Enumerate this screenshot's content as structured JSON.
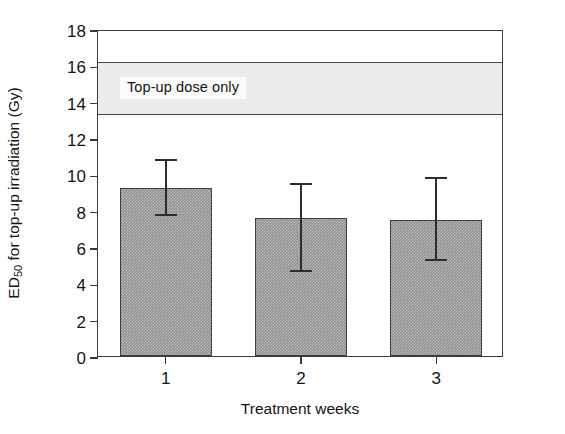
{
  "chart_data": {
    "type": "bar",
    "title": "",
    "xlabel": "Treatment weeks",
    "ylabel": "ED50 for top-up irradiation (Gy)",
    "ylabel_base": "ED",
    "ylabel_sub": "50",
    "ylabel_rest": " for top-up irradiation (Gy)",
    "categories": [
      "1",
      "2",
      "3"
    ],
    "values": [
      9.25,
      7.6,
      7.5
    ],
    "error_upper": [
      10.85,
      9.5,
      9.85
    ],
    "error_lower": [
      7.7,
      4.65,
      5.25
    ],
    "ylim": [
      0,
      18
    ],
    "yticks": [
      0,
      2,
      4,
      6,
      8,
      10,
      12,
      14,
      16,
      18
    ],
    "ytick_labels": [
      "0",
      "2",
      "4",
      "6",
      "8",
      "10",
      "12",
      "14",
      "16",
      "18"
    ],
    "xtick_labels": [
      "1",
      "2",
      "3"
    ],
    "grid": false,
    "legend_position": "none",
    "annotations": [
      {
        "name": "top-up-dose-band",
        "label": "Top-up dose only",
        "y_from": 13.4,
        "y_to": 16.3,
        "fill_color": "#ececec",
        "edge_color": "#4a4a4a"
      }
    ],
    "bar_fill_color": "#8e8e8e",
    "bar_edge_color": "#3d3d3d",
    "error_bar_color": "#2e2e2e",
    "axis_color": "#3a3a3a",
    "background_color": "#ffffff"
  },
  "axes": {
    "y": {
      "title_prefix": "ED",
      "title_subscript": "50",
      "title_suffix": " for top-up irradiation (Gy)",
      "ticks": [
        "18",
        "16",
        "14",
        "12",
        "10",
        "8",
        "6",
        "4",
        "2",
        "0"
      ]
    },
    "x": {
      "title": "Treatment weeks",
      "ticks": [
        "1",
        "2",
        "3"
      ]
    }
  },
  "band": {
    "label": "Top-up dose only"
  },
  "bars": [
    {
      "category": "1",
      "value": "9.25",
      "err_top": "10.85",
      "err_bottom": "7.7"
    },
    {
      "category": "2",
      "value": "7.6",
      "err_top": "9.5",
      "err_bottom": "4.65"
    },
    {
      "category": "3",
      "value": "7.5",
      "err_top": "9.85",
      "err_bottom": "5.25"
    }
  ]
}
